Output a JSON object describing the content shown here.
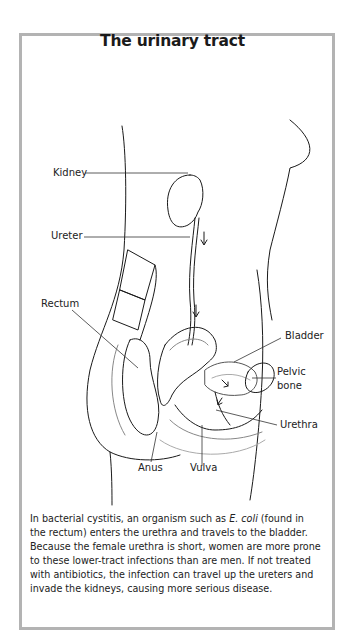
{
  "figure": {
    "title": "The urinary tract",
    "labels": {
      "kidney": "Kidney",
      "ureter": "Ureter",
      "rectum": "Rectum",
      "bladder": "Bladder",
      "pelvic_bone_1": "Pelvic",
      "pelvic_bone_2": "bone",
      "urethra": "Urethra",
      "anus": "Anus",
      "vulva": "Vulva"
    },
    "caption": {
      "part1": "In bacterial cystitis, an organism such as ",
      "italic": "E. coli",
      "part2": " (found in the rectum) enters the urethra and travels to the bladder. Because the female urethra is short, women are more prone to these lower-tract infections than are men. If not treated with antibiotics, the infection can travel up the ureters and invade the kidneys, causing more serious disease."
    },
    "colors": {
      "border": "#b3b3b3",
      "line": "#1a1a1a",
      "shading": "#c8c8c8"
    }
  }
}
